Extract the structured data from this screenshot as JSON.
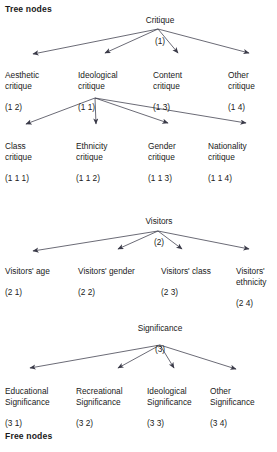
{
  "diagram": {
    "title_top": "Tree nodes",
    "title_bottom": "Free nodes",
    "line_color": "#3a3a48",
    "text_color": "#1a1a1a",
    "background": "#ffffff"
  },
  "trees": [
    {
      "id": "critique",
      "root": {
        "label": "Critique",
        "code": "(1)"
      },
      "children": [
        {
          "label": "Aesthetic\ncritique",
          "code": "(1 2)"
        },
        {
          "label": "Ideological\ncritique",
          "code": "(1 1)"
        },
        {
          "label": "Content\ncritique",
          "code": "(1 3)"
        },
        {
          "label": "Other\ncritique",
          "code": "(1 4)"
        }
      ],
      "grandchildren_parent": "Ideological critique",
      "grandchildren": [
        {
          "label": "Class\ncritique",
          "code": "(1 1 1)"
        },
        {
          "label": "Ethnicity\ncritique",
          "code": "(1 1 2)"
        },
        {
          "label": "Gender\ncritique",
          "code": "(1 1 3)"
        },
        {
          "label": "Nationality\ncritique",
          "code": "(1 1 4)"
        }
      ]
    },
    {
      "id": "visitors",
      "root": {
        "label": "Visitors",
        "code": "(2)"
      },
      "children": [
        {
          "label": "Visitors' age",
          "code": "(2 1)"
        },
        {
          "label": "Visitors' gender",
          "code": "(2 2)"
        },
        {
          "label": "Visitors' class",
          "code": "(2 3)"
        },
        {
          "label": "Visitors'\nethnicity",
          "code": "(2 4)"
        }
      ]
    },
    {
      "id": "significance",
      "root": {
        "label": "Significance",
        "code": "(3)"
      },
      "children": [
        {
          "label": "Educational\nSignificance",
          "code": "(3 1)"
        },
        {
          "label": "Recreational\nSignificance",
          "code": "(3 2)"
        },
        {
          "label": "Ideological\nSignificance",
          "code": "(3 3)"
        },
        {
          "label": "Other\nSignificance",
          "code": "(3 4)"
        }
      ]
    }
  ]
}
